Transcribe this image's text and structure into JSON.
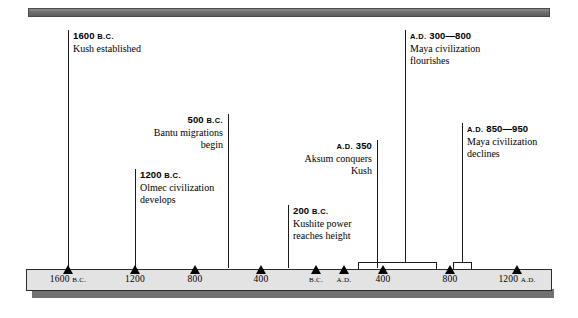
{
  "figure": {
    "type": "timeline",
    "orientation": "horizontal",
    "axis": {
      "ticks": [
        {
          "label": "1600",
          "era": "B.C.",
          "x": 68
        },
        {
          "label": "1200",
          "era": "",
          "x": 135
        },
        {
          "label": "800",
          "era": "",
          "x": 195
        },
        {
          "label": "400",
          "era": "",
          "x": 261
        },
        {
          "label": "",
          "era": "B.C.",
          "x": 316
        },
        {
          "label": "",
          "era": "A.D.",
          "x": 344
        },
        {
          "label": "400",
          "era": "",
          "x": 383
        },
        {
          "label": "800",
          "era": "",
          "x": 450
        },
        {
          "label": "1200",
          "era": "A.D.",
          "x": 517
        }
      ]
    },
    "events": [
      {
        "name": "kush-established",
        "date": "1600",
        "era": "B.C.",
        "description_lines": [
          "Kush established"
        ],
        "align": "left",
        "anchor_x": 68,
        "text_x": 73,
        "text_y": 30,
        "line_top": 30,
        "line_bottom": 268
      },
      {
        "name": "olmec-civilization-develops",
        "date": "1200",
        "era": "B.C.",
        "description_lines": [
          "Olmec civilization",
          "develops"
        ],
        "align": "left",
        "anchor_x": 135,
        "text_x": 140,
        "text_y": 169,
        "line_top": 169,
        "line_bottom": 268
      },
      {
        "name": "bantu-migrations-begin",
        "date": "500",
        "era": "B.C.",
        "description_lines": [
          "Bantu migrations",
          "begin"
        ],
        "align": "right",
        "anchor_x": 228,
        "text_x": 223,
        "text_y": 114,
        "line_top": 114,
        "line_bottom": 268
      },
      {
        "name": "kushite-power-reaches-height",
        "date": "200",
        "era": "B.C.",
        "description_lines": [
          "Kushite power",
          "reaches height"
        ],
        "align": "left",
        "anchor_x": 288,
        "text_x": 293,
        "text_y": 205,
        "line_top": 205,
        "line_bottom": 268
      },
      {
        "name": "aksum-conquers-kush",
        "date": "350",
        "era": "A.D.",
        "description_lines": [
          "Aksum conquers",
          "Kush"
        ],
        "align": "right",
        "anchor_x": 377,
        "text_x": 372,
        "text_y": 140,
        "line_top": 140,
        "line_bottom": 268
      },
      {
        "name": "maya-civilization-flourishes",
        "date": "300—800",
        "era": "A.D.",
        "description_lines": [
          "Maya civilization",
          "flourishes"
        ],
        "align": "left",
        "anchor_x": 405,
        "text_x": 410,
        "text_y": 30,
        "line_top": 30,
        "line_bottom": 262
      },
      {
        "name": "maya-civilization-declines",
        "date": "850—950",
        "era": "A.D.",
        "description_lines": [
          "Maya civilization",
          "declines"
        ],
        "align": "left",
        "anchor_x": 462,
        "text_x": 467,
        "text_y": 123,
        "line_top": 123,
        "line_bottom": 262
      }
    ],
    "span_brackets": [
      {
        "name": "maya-flourishes-span",
        "left": 358,
        "right": 437,
        "top": 262,
        "height": 11,
        "stem_x": 405
      },
      {
        "name": "maya-declines-span",
        "left": 453,
        "right": 472,
        "top": 262,
        "height": 11,
        "stem_x": 462
      }
    ]
  }
}
